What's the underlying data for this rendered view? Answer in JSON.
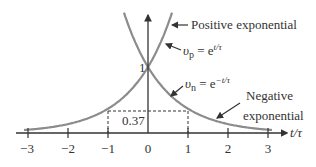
{
  "chart_data": {
    "type": "line",
    "title": "",
    "xlabel": "t/τ",
    "ylabel": "",
    "xlim": [
      -3.1,
      3.1
    ],
    "ylim": [
      0,
      2.0
    ],
    "x_ticks": [
      -3,
      -2,
      -1,
      0,
      1,
      2,
      3
    ],
    "x_tick_labels": [
      "−3",
      "−2",
      "−1",
      "0",
      "1",
      "2",
      "3"
    ],
    "y_tick_labels": [
      {
        "value": 1,
        "label": "1"
      },
      {
        "value": 0.37,
        "label": "0.37"
      }
    ],
    "grid": false,
    "series": [
      {
        "name": "Positive exponential",
        "formula": "v_p = e^{t/τ}",
        "x": [
          -3,
          -2,
          -1,
          0,
          0.5,
          0.65
        ],
        "values": [
          0.05,
          0.135,
          0.368,
          1.0,
          1.649,
          1.916
        ]
      },
      {
        "name": "Negative exponential",
        "formula": "v_n = e^{-t/τ}",
        "x": [
          -0.65,
          -0.5,
          0,
          1,
          2,
          3
        ],
        "values": [
          1.916,
          1.649,
          1.0,
          0.368,
          0.135,
          0.05
        ]
      }
    ],
    "annotations": [
      {
        "text": "Positive exponential"
      },
      {
        "text": "v_p = e^{t/τ}"
      },
      {
        "text": "v_n = e^{−t/τ}"
      },
      {
        "text": "Negative exponential"
      },
      {
        "text": "0.37 at t/τ = ±1 (dashed guides)"
      }
    ]
  },
  "labels": {
    "x_axis": "t/τ",
    "one": "1",
    "p37": "0.37",
    "pos_exp": "Positive exponential",
    "vp_sym": "υ",
    "vp_sub": "p",
    "vp_eq": " = e",
    "vp_exp": "t/τ",
    "vn_sym": "υ",
    "vn_sub": "n",
    "vn_eq": " = e",
    "vn_exp": "−t/τ",
    "neg_line1": "Negative",
    "neg_line2": "exponential",
    "ticks": [
      "−3",
      "−2",
      "−1",
      "0",
      "1",
      "2",
      "3"
    ]
  },
  "style": {
    "curve_color": "#8c8c8c",
    "axis_color": "#333333"
  }
}
